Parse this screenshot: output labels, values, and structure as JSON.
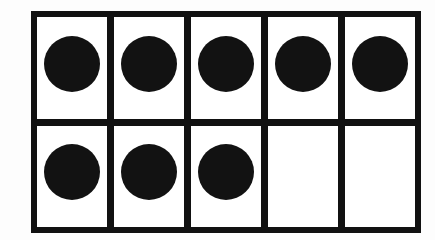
{
  "figure": {
    "kind": "ten-frame",
    "rows": 2,
    "columns": 5,
    "total_cells": 10,
    "filled_count": 8,
    "empty_count": 2
  },
  "colors": {
    "background": "#fdfdfd",
    "frame_line": "#111111",
    "cell_fill": "#ffffff",
    "counter": "#121212"
  },
  "geometry": {
    "frame_left": 31,
    "frame_top": 11,
    "frame_width": 390,
    "frame_height": 222,
    "line_thickness": 6,
    "divider_thickness": 7,
    "counter_diameter": 56
  },
  "grid": {
    "rows": [
      {
        "name": "top-row",
        "index": 0,
        "filled": 5,
        "cells": [
          {
            "index": 0,
            "position": "r1c1",
            "filled": true,
            "state": "counter"
          },
          {
            "index": 1,
            "position": "r1c2",
            "filled": true,
            "state": "counter"
          },
          {
            "index": 2,
            "position": "r1c3",
            "filled": true,
            "state": "counter"
          },
          {
            "index": 3,
            "position": "r1c4",
            "filled": true,
            "state": "counter"
          },
          {
            "index": 4,
            "position": "r1c5",
            "filled": true,
            "state": "counter"
          }
        ]
      },
      {
        "name": "bottom-row",
        "index": 1,
        "filled": 3,
        "cells": [
          {
            "index": 5,
            "position": "r2c1",
            "filled": true,
            "state": "counter"
          },
          {
            "index": 6,
            "position": "r2c2",
            "filled": true,
            "state": "counter"
          },
          {
            "index": 7,
            "position": "r2c3",
            "filled": true,
            "state": "counter"
          },
          {
            "index": 8,
            "position": "r2c4",
            "filled": false,
            "state": "empty"
          },
          {
            "index": 9,
            "position": "r2c5",
            "filled": false,
            "state": "empty"
          }
        ]
      }
    ]
  }
}
